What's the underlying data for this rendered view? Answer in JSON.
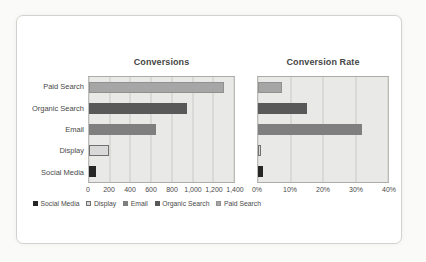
{
  "series_colors": {
    "Social Media": {
      "fill": "#262626",
      "border": "#262626"
    },
    "Display": {
      "fill": "#d9d9d9",
      "border": "#707070"
    },
    "Email": {
      "fill": "#7f7f7f",
      "border": "#7f7f7f"
    },
    "Organic Search": {
      "fill": "#595959",
      "border": "#595959"
    },
    "Paid Search": {
      "fill": "#a6a6a6",
      "border": "#919191"
    }
  },
  "chart_data": [
    {
      "type": "bar",
      "orientation": "horizontal",
      "title": "Conversions",
      "categories": [
        "Paid Search",
        "Organic Search",
        "Email",
        "Display",
        "Social Media"
      ],
      "values": [
        1300,
        950,
        650,
        190,
        70
      ],
      "xlim": [
        0,
        1400
      ],
      "xticks": [
        "0",
        "200",
        "400",
        "600",
        "800",
        "1,000",
        "1,200",
        "1,400"
      ],
      "grid": true,
      "show_category_labels": true,
      "legend": {
        "position": "bottom",
        "entries": [
          "Social Media",
          "Display",
          "Email",
          "Organic Search",
          "Paid Search"
        ]
      }
    },
    {
      "type": "bar",
      "orientation": "horizontal",
      "title": "Conversion Rate",
      "categories": [
        "Paid Search",
        "Organic Search",
        "Email",
        "Display",
        "Social Media"
      ],
      "values": [
        7.5,
        15,
        32,
        1,
        1.5
      ],
      "unit": "%",
      "xlim": [
        0,
        40
      ],
      "xticks": [
        "0%",
        "10%",
        "20%",
        "30%",
        "40%"
      ],
      "grid": true,
      "show_category_labels": false,
      "legend": null
    }
  ]
}
